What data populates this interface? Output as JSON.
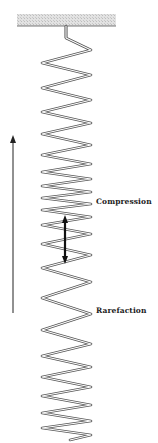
{
  "diagram": {
    "type": "longitudinal-wave-spring",
    "labels": {
      "compression": "Compression",
      "rarefaction": "Rarefaction"
    },
    "ceiling": {
      "x": 17,
      "y": 14,
      "width": 99,
      "height": 12,
      "fill": "#d6d6d6",
      "edge": "#555555"
    },
    "hook": {
      "x": 66,
      "y_top": 26,
      "y_bottom": 38
    },
    "spring": {
      "left_x": 42,
      "right_x": 91,
      "vertex_y": [
        50,
        63,
        75,
        88,
        100,
        112,
        123,
        134,
        145,
        155,
        164,
        172,
        179,
        186,
        192,
        198,
        204,
        210,
        217,
        225,
        234,
        244,
        255,
        268,
        282,
        298,
        314,
        330,
        344,
        356,
        367,
        377,
        387,
        396,
        405,
        413,
        421,
        428,
        435
      ],
      "end": {
        "x": 70,
        "y": 440
      },
      "stroke": "#555555"
    },
    "propagation_arrow": {
      "x": 13,
      "y_top": 135,
      "y_bottom": 313,
      "color": "#222222"
    },
    "wavelength_arrow": {
      "x": 65,
      "y_top": 215,
      "y_bottom": 264,
      "color": "#111111"
    }
  }
}
